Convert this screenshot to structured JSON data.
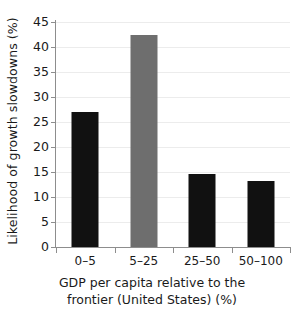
{
  "chart_data": {
    "type": "bar",
    "title": "",
    "categories": [
      "0–5",
      "5–25",
      "25–50",
      "50–100"
    ],
    "values": [
      27.0,
      42.5,
      14.6,
      13.3
    ],
    "bar_colors": [
      "#111111",
      "#6e6e6e",
      "#111111",
      "#111111"
    ],
    "xlabel_line1": "GDP per capita relative to the",
    "xlabel_line2": "frontier (United States) (%)",
    "ylabel": "Likelihood of growth slowdowns (%)",
    "ylim": [
      0,
      45
    ],
    "ytick_step": 5,
    "yticks": [
      0,
      5,
      10,
      15,
      20,
      25,
      30,
      35,
      40,
      45
    ],
    "ytick_labels": [
      "0",
      "5",
      "10",
      "15",
      "20",
      "25",
      "30",
      "35",
      "40",
      "45"
    ],
    "grid": "horizontal",
    "gridline_color": "#ececec",
    "legend": "none",
    "axis_color": "#8d8d8d",
    "background": "#ffffff"
  }
}
